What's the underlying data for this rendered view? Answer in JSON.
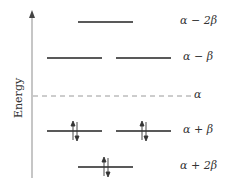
{
  "diagram": {
    "type": "molecular-orbital-energy-level-diagram",
    "axis_label": "Energy",
    "reference_label": "α",
    "levels": [
      {
        "label": "α − 2β",
        "count": 1,
        "electrons": [
          0
        ]
      },
      {
        "label": "α − β",
        "count": 2,
        "electrons": [
          0,
          0
        ]
      },
      {
        "label": "α + β",
        "count": 2,
        "electrons": [
          2,
          2
        ]
      },
      {
        "label": "α + 2β",
        "count": 1,
        "electrons": [
          2
        ]
      }
    ],
    "colors": {
      "line": "#222222",
      "axis": "#999999",
      "dash": "#999999",
      "text": "#333333"
    }
  }
}
